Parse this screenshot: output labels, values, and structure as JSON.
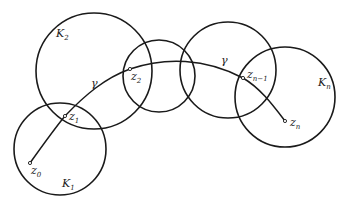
{
  "diagram": {
    "type": "chain-of-disks",
    "stroke_color": "#1a1a1a",
    "background": "#ffffff",
    "circles": [
      {
        "id": "K1",
        "label": "K",
        "sub": "1",
        "cx": 60,
        "cy": 149,
        "r": 46,
        "label_x": 62,
        "label_y": 187
      },
      {
        "id": "K2",
        "label": "K",
        "sub": "2",
        "cx": 94,
        "cy": 71,
        "r": 58,
        "label_x": 56,
        "label_y": 37
      },
      {
        "id": "K3",
        "label": "",
        "sub": "",
        "cx": 159,
        "cy": 76,
        "r": 36
      },
      {
        "id": "K4",
        "label": "",
        "sub": "",
        "cx": 228,
        "cy": 70,
        "r": 48
      },
      {
        "id": "Kn",
        "label": "K",
        "sub": "n",
        "cx": 285,
        "cy": 97,
        "r": 50,
        "label_x": 318,
        "label_y": 86
      }
    ],
    "curve": {
      "label": "γ",
      "label_positions": [
        {
          "x": 91,
          "y": 87
        },
        {
          "x": 221,
          "y": 64
        }
      ]
    },
    "points": [
      {
        "id": "z0",
        "label": "z",
        "sub": "0",
        "x": 30,
        "y": 163,
        "label_x": 31,
        "label_y": 174
      },
      {
        "id": "z1",
        "label": "z",
        "sub": "1",
        "x": 65,
        "y": 116,
        "label_x": 69,
        "label_y": 120
      },
      {
        "id": "z2",
        "label": "z",
        "sub": "2",
        "x": 130,
        "y": 69,
        "label_x": 131,
        "label_y": 80
      },
      {
        "id": "zn-1",
        "label": "z",
        "sub": "n−1",
        "x": 243,
        "y": 78,
        "label_x": 247,
        "label_y": 78
      },
      {
        "id": "zn",
        "label": "z",
        "sub": "n",
        "x": 285,
        "y": 121,
        "label_x": 290,
        "label_y": 126
      }
    ],
    "caption": ""
  }
}
